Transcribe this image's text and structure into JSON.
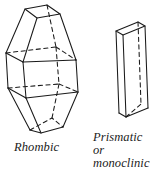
{
  "figure": {
    "name": "crystal-habit-diagram",
    "background_color": "#ffffff",
    "stroke_color": "#1a1a1a",
    "fill_color": "#ffffff"
  },
  "captions": {
    "rhombic": "Rhombic",
    "prismatic_line1": "Prismatic",
    "prismatic_line2": "or",
    "prismatic_line3": "monoclinic"
  },
  "crystals": [
    {
      "id": "rhombic-crystal",
      "label": "Rhombic",
      "description": "Rhombic bipyramidal crystal drawn in line art with hidden edges dashed"
    },
    {
      "id": "prismatic-crystal",
      "label": "Prismatic or monoclinic",
      "description": "Thin prismatic slab crystal drawn in line art with a hidden vertical edge dashed"
    }
  ]
}
